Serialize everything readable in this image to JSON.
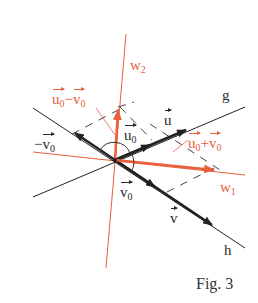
{
  "figure": {
    "caption": "Fig. 3",
    "colors": {
      "black": "#222222",
      "orange": "#e8603c",
      "dash": "#444444"
    },
    "origin": [
      115,
      160
    ],
    "lines": {
      "g": {
        "label": "g",
        "from": [
          33,
          197
        ],
        "to": [
          245,
          107
        ]
      },
      "h": {
        "label": "h",
        "from": [
          33,
          108
        ],
        "to": [
          245,
          248
        ]
      },
      "w1": {
        "label_main": "w",
        "label_sub": "1",
        "from": [
          33,
          152
        ],
        "to": [
          245,
          175
        ]
      },
      "w2": {
        "label_main": "w",
        "label_sub": "2",
        "from": [
          126,
          34
        ],
        "to": [
          106,
          268
        ]
      }
    },
    "vectors": {
      "u0": {
        "label_main": "u",
        "label_sub": "0",
        "to": [
          150,
          145
        ]
      },
      "u": {
        "label_main": "u",
        "label_sub": "",
        "to": [
          186,
          130
        ]
      },
      "v0": {
        "label_main": "v",
        "label_sub": "0",
        "to": [
          155,
          187
        ]
      },
      "v": {
        "label_main": "v",
        "label_sub": "",
        "to": [
          212,
          225
        ]
      },
      "minus_v0": {
        "prefix": "−",
        "label_main": "v",
        "label_sub": "0",
        "to": [
          75,
          133
        ]
      },
      "u0_minus_v0": {
        "a_main": "u",
        "a_sub": "0",
        "op": "−",
        "b_main": "v",
        "b_sub": "0",
        "to": [
          118,
          110
        ]
      },
      "u0_plus_v0": {
        "a_main": "u",
        "a_sub": "0",
        "op": "+",
        "b_main": "v",
        "b_sub": "0",
        "to": [
          214,
          170
        ]
      }
    }
  }
}
